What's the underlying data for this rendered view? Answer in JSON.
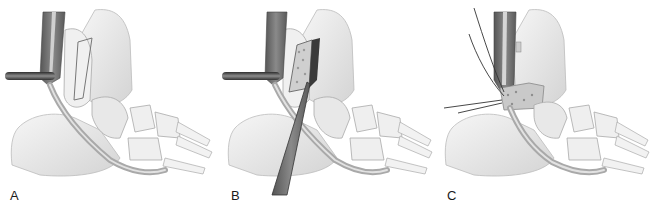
{
  "figure": {
    "panels": [
      {
        "label": "A",
        "content": "Tendons retracted by instrument; outlined bone flap on distal fibula"
      },
      {
        "label": "B",
        "content": "Retractor holding tendons; elevated bone block; elevator instrument inserted"
      },
      {
        "label": "C",
        "content": "Bone block repositioned and secured with sutures; tendons replaced"
      }
    ]
  },
  "colors": {
    "background": "#ffffff",
    "bone": "#ececec",
    "bone_shadow": "#c8c8c8",
    "muscle": "#6e6e6e",
    "tendon": "#bdbdbd",
    "instrument": "#4a4a4a",
    "outline": "#8a8a8a",
    "label": "#1a1a1a"
  }
}
